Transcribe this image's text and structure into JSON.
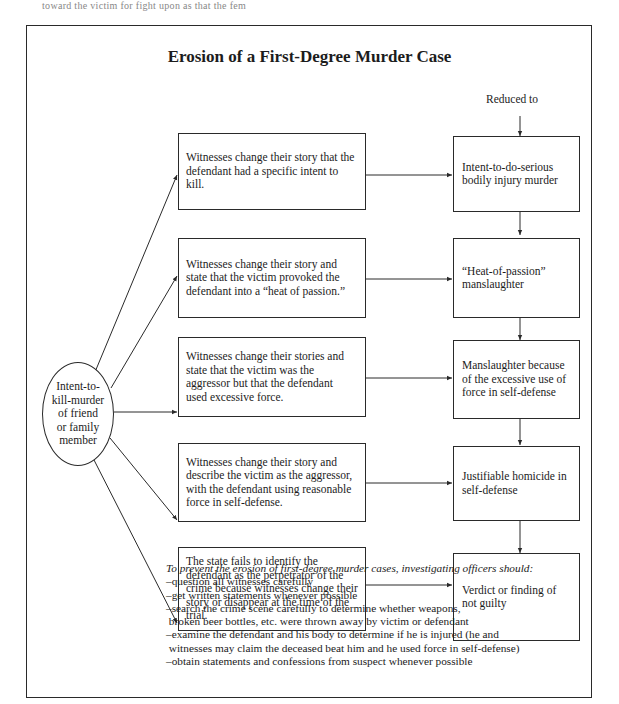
{
  "page_header_fragment": "toward the victim    for fight upon as that the fem",
  "title": "Erosion of a First-Degree Murder Case",
  "reduced_label": "Reduced to",
  "origin": {
    "lines": [
      "Intent-to-",
      "kill-murder",
      "of friend",
      "or family",
      "member"
    ]
  },
  "witness_boxes": [
    {
      "lines": [
        "Witnesses change their story that the",
        "defendant had a specific intent to",
        "kill."
      ]
    },
    {
      "lines": [
        "Witnesses change their story and",
        "state that the victim provoked the",
        "defendant into a “heat of passion.”"
      ]
    },
    {
      "lines": [
        "Witnesses change their stories and",
        "state that the victim was the",
        "aggressor but that the defendant",
        "used excessive force."
      ]
    },
    {
      "lines": [
        "Witnesses change their story and",
        "describe the victim as the aggressor,",
        "with the defendant using reasonable",
        "force in self-defense."
      ]
    },
    {
      "lines": [
        "The state fails to identify the",
        "defendant as the perpetrator of the",
        "crime because witnesses change their",
        "story or disappear at the time of the",
        "trial."
      ]
    }
  ],
  "outcome_boxes": [
    {
      "lines": [
        "Intent-to-do-serious",
        "bodily injury murder"
      ]
    },
    {
      "lines": [
        "“Heat-of-passion”",
        "manslaughter"
      ]
    },
    {
      "lines": [
        "Manslaughter because",
        "of the excessive use of",
        "force in self-defense"
      ]
    },
    {
      "lines": [
        "Justifiable homicide in",
        "self-defense"
      ]
    },
    {
      "lines": [
        "Verdict or finding of",
        "not guilty"
      ]
    }
  ],
  "notes": {
    "heading": "To prevent the erosion of first-degree murder cases, investigating officers should:",
    "items": [
      "–question all witnesses carefully",
      "–get written statements whenever possible",
      "–search the crime scene carefully to determine whether weapons,",
      " broken beer bottles, etc. were thrown away by victim or defendant",
      "–examine the defendant and his body to determine if he is injured (he and",
      " witnesses may claim the deceased beat him and he used force in self-defense)",
      "–obtain statements and confessions from suspect whenever possible"
    ]
  }
}
